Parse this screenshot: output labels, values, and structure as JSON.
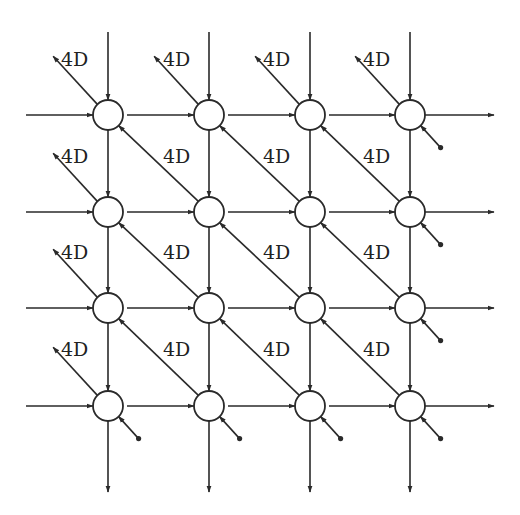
{
  "diagram": {
    "type": "systolic-array",
    "rows": 4,
    "cols": 4,
    "col_x": [
      108,
      209,
      310,
      410
    ],
    "row_y": [
      115,
      212,
      308,
      406
    ],
    "node_radius": 15,
    "delay_label": "4D",
    "colors": {
      "stroke": "#2a2a2a",
      "background": "#ffffff",
      "text": "#222222"
    },
    "edges": {
      "vertical_input_top_y": 32,
      "vertical_output_bottom_y": 492,
      "horizontal_input_left_x": 26,
      "horizontal_output_right_x": 494
    },
    "labels": [
      {
        "text": "4D",
        "x": 61,
        "y": 66
      },
      {
        "text": "4D",
        "x": 163,
        "y": 66
      },
      {
        "text": "4D",
        "x": 263,
        "y": 66
      },
      {
        "text": "4D",
        "x": 363,
        "y": 66
      },
      {
        "text": "4D",
        "x": 61,
        "y": 163
      },
      {
        "text": "4D",
        "x": 163,
        "y": 163
      },
      {
        "text": "4D",
        "x": 263,
        "y": 163
      },
      {
        "text": "4D",
        "x": 363,
        "y": 163
      },
      {
        "text": "4D",
        "x": 61,
        "y": 259
      },
      {
        "text": "4D",
        "x": 163,
        "y": 259
      },
      {
        "text": "4D",
        "x": 263,
        "y": 259
      },
      {
        "text": "4D",
        "x": 363,
        "y": 259
      },
      {
        "text": "4D",
        "x": 61,
        "y": 356
      },
      {
        "text": "4D",
        "x": 163,
        "y": 356
      },
      {
        "text": "4D",
        "x": 263,
        "y": 356
      },
      {
        "text": "4D",
        "x": 363,
        "y": 356
      }
    ]
  }
}
